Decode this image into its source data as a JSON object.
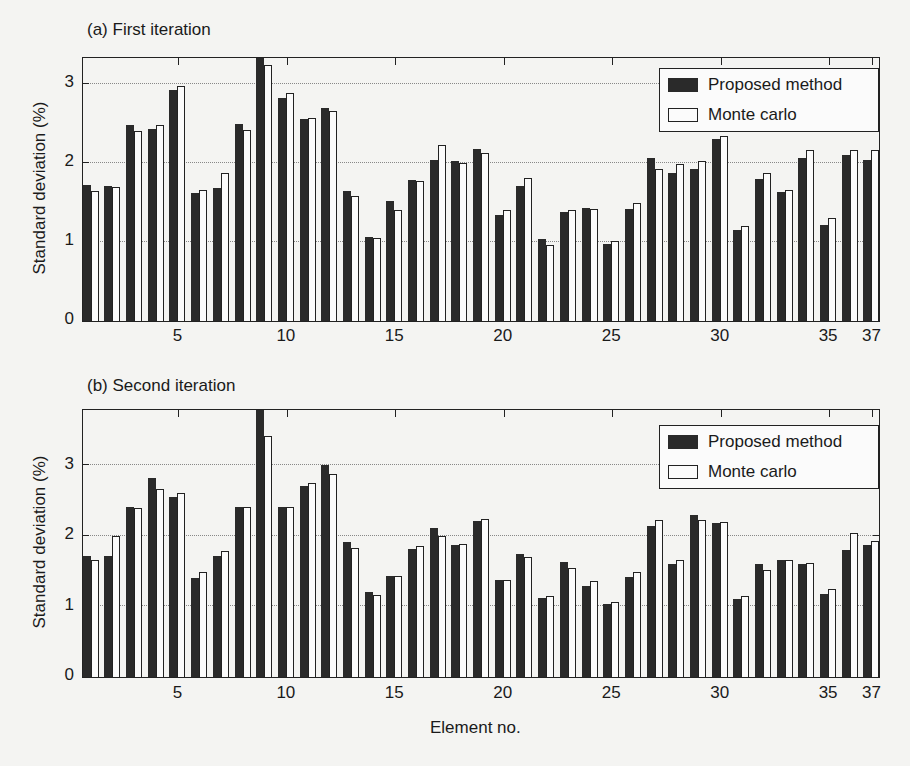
{
  "figure": {
    "xlabel": "Element no.",
    "ylabel": "Standard deviation (%)",
    "legend": {
      "proposed": "Proposed method",
      "monte_carlo": "Monte carlo"
    },
    "colors": {
      "proposed": "#2a2a2a",
      "monte_carlo": "#fbfbfb",
      "edge": "#222222",
      "grid": "#888888"
    },
    "xtick_labels": [
      "5",
      "10",
      "15",
      "20",
      "25",
      "30",
      "35",
      "37"
    ],
    "panels": [
      {
        "title": "(a) First iteration",
        "ytick_labels": [
          "0",
          "1",
          "2",
          "3"
        ]
      },
      {
        "title": "(b) Second iteration",
        "ytick_labels": [
          "0",
          "1",
          "2",
          "3"
        ]
      }
    ]
  },
  "chart_data": [
    {
      "type": "bar",
      "title": "(a) First iteration",
      "xlabel": "",
      "ylabel": "Standard deviation (%)",
      "ylim": [
        0,
        3.33
      ],
      "xlim": [
        0.6,
        37.3
      ],
      "grid": "y dotted at 1, 2, 3",
      "legend_position": "upper right",
      "categories": [
        1,
        2,
        3,
        4,
        5,
        6,
        7,
        8,
        9,
        10,
        11,
        12,
        13,
        14,
        15,
        16,
        17,
        18,
        19,
        20,
        21,
        22,
        23,
        24,
        25,
        26,
        27,
        28,
        29,
        30,
        31,
        32,
        33,
        34,
        35,
        36,
        37
      ],
      "xticks": [
        5,
        10,
        15,
        20,
        25,
        30,
        35,
        37
      ],
      "series": [
        {
          "name": "Proposed method",
          "values": [
            1.72,
            1.71,
            2.48,
            2.43,
            2.93,
            1.62,
            1.69,
            2.49,
            3.35,
            2.83,
            2.56,
            2.7,
            1.65,
            1.06,
            1.52,
            1.79,
            2.04,
            2.03,
            2.18,
            1.34,
            1.71,
            1.04,
            1.38,
            1.43,
            0.97,
            1.42,
            2.07,
            1.88,
            1.92,
            2.31,
            1.15,
            1.8,
            1.63,
            2.07,
            1.22,
            2.1,
            2.04
          ]
        },
        {
          "name": "Monte carlo",
          "values": [
            1.65,
            1.7,
            2.4,
            2.48,
            2.97,
            1.66,
            1.88,
            2.42,
            3.24,
            2.89,
            2.57,
            2.66,
            1.58,
            1.05,
            1.41,
            1.77,
            2.23,
            2.0,
            2.13,
            1.41,
            1.81,
            0.96,
            1.4,
            1.42,
            1.01,
            1.49,
            1.92,
            1.99,
            2.03,
            2.34,
            1.2,
            1.87,
            1.66,
            2.16,
            1.3,
            2.17,
            2.16
          ]
        }
      ]
    },
    {
      "type": "bar",
      "title": "(b) Second iteration",
      "xlabel": "Element no.",
      "ylabel": "Standard deviation (%)",
      "ylim": [
        0,
        3.78
      ],
      "xlim": [
        0.6,
        37.3
      ],
      "grid": "y dotted at 1, 2, 3",
      "legend_position": "upper right",
      "categories": [
        1,
        2,
        3,
        4,
        5,
        6,
        7,
        8,
        9,
        10,
        11,
        12,
        13,
        14,
        15,
        16,
        17,
        18,
        19,
        20,
        21,
        22,
        23,
        24,
        25,
        26,
        27,
        28,
        29,
        30,
        31,
        32,
        33,
        34,
        35,
        36,
        37
      ],
      "xticks": [
        5,
        10,
        15,
        20,
        25,
        30,
        35,
        37
      ],
      "series": [
        {
          "name": "Proposed method",
          "values": [
            1.71,
            1.71,
            2.4,
            2.82,
            2.55,
            1.4,
            1.71,
            2.4,
            3.8,
            2.4,
            2.7,
            3.0,
            1.91,
            1.2,
            1.43,
            1.81,
            2.11,
            1.87,
            2.21,
            1.37,
            1.74,
            1.12,
            1.63,
            1.29,
            1.03,
            1.42,
            2.14,
            1.6,
            2.29,
            2.18,
            1.1,
            1.6,
            1.66,
            1.6,
            1.17,
            1.8,
            1.87
          ]
        },
        {
          "name": "Monte carlo",
          "values": [
            1.66,
            1.99,
            2.39,
            2.66,
            2.61,
            1.49,
            1.78,
            2.4,
            3.41,
            2.4,
            2.75,
            2.88,
            1.82,
            1.16,
            1.43,
            1.86,
            2.0,
            1.88,
            2.23,
            1.37,
            1.7,
            1.14,
            1.55,
            1.36,
            1.06,
            1.49,
            2.22,
            1.65,
            2.22,
            2.2,
            1.14,
            1.52,
            1.66,
            1.62,
            1.25,
            2.04,
            1.93
          ]
        }
      ]
    }
  ]
}
